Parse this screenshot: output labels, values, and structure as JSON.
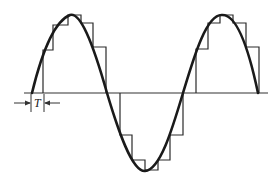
{
  "diagram": {
    "sample_period_label": "T",
    "colors": {
      "curve": "#1a1a1a",
      "steps": "#2a2a2a",
      "axis": "#333333",
      "background": "#ffffff"
    },
    "axis": {
      "x1": 24,
      "x2": 268,
      "y": 93
    },
    "sine": {
      "x_start": 32,
      "x_end": 258,
      "amplitude_px": 78,
      "periods": 1.5
    },
    "steps_upper_1": [
      [
        43,
        50
      ],
      [
        53,
        25
      ],
      [
        68,
        15
      ],
      [
        81,
        23
      ],
      [
        93,
        47
      ]
    ],
    "steps_lower": [
      [
        120,
        135
      ],
      [
        132,
        160
      ],
      [
        145,
        170
      ],
      [
        158,
        160
      ],
      [
        170,
        135
      ]
    ],
    "steps_upper_2": [
      [
        196,
        49
      ],
      [
        208,
        23
      ],
      [
        220,
        15
      ],
      [
        233,
        23
      ],
      [
        246,
        47
      ]
    ],
    "T_marker": {
      "x1": 31,
      "x2": 44,
      "y": 103
    }
  }
}
